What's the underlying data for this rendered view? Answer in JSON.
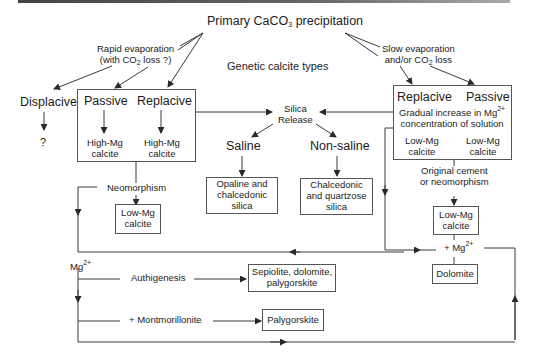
{
  "diagram": {
    "title_parts": {
      "pre": "Primary CaCO",
      "sub": "3",
      "post": " precipitation"
    },
    "center_label": "Genetic calcite types",
    "rapid": {
      "line1": "Rapid evaporation",
      "line2_pre": "(with CO",
      "line2_sub": "2",
      "line2_post": " loss ?)"
    },
    "slow": {
      "line1": "Slow evaporation",
      "line2_pre": "and/or CO",
      "line2_sub": "2",
      "line2_post": " loss"
    },
    "displacive": {
      "label": "Displacive",
      "result": "?"
    },
    "left_box": {
      "passive": "Passive",
      "replacive": "Replacive",
      "passive_result": [
        "High-Mg",
        "calcite"
      ],
      "replacive_result": [
        "High-Mg",
        "calcite"
      ]
    },
    "right_box": {
      "replacive": "Replacive",
      "passive": "Passive",
      "note_line1_pre": "Gradual increase in Mg",
      "note_line1_sup": "2+",
      "note_line2": "concentration of solution",
      "replacive_result": [
        "Low-Mg",
        "calcite"
      ],
      "passive_result": [
        "Low-Mg",
        "calcite"
      ]
    },
    "silica": {
      "release": [
        "Silica",
        "Release"
      ],
      "saline": "Saline",
      "non_saline": "Non-saline",
      "saline_product": [
        "Opaline and",
        "chalcedonic",
        "silica"
      ],
      "non_saline_product": [
        "Chalcedonic",
        "and quartzose",
        "silica"
      ]
    },
    "neomorphism": {
      "label": "Neomorphism",
      "product": [
        "Low-Mg",
        "calcite"
      ]
    },
    "original_cement": {
      "label": [
        "Original cement",
        "or neomorphism"
      ],
      "product": [
        "Low-Mg",
        "calcite"
      ]
    },
    "mg_right": {
      "pre": "+ Mg",
      "sup": "2+",
      "product": "Dolomite"
    },
    "mg_left": {
      "pre": "Mg",
      "sup": "2+"
    },
    "authigenesis": {
      "label": "Authigenesis",
      "product": [
        "Sepiolite, dolomite,",
        "palygorskite"
      ]
    },
    "montmorillonite": {
      "label": "+ Montmorillonite",
      "product": "Palygorskite"
    },
    "colors": {
      "line": "#3a3a3a",
      "text": "#1c1c1c",
      "background": "#ffffff"
    }
  }
}
